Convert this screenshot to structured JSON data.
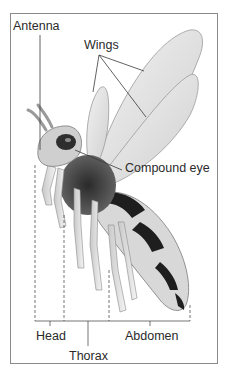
{
  "diagram": {
    "labels": {
      "antenna": "Antenna",
      "wings": "Wings",
      "compound_eye": "Compound eye",
      "head": "Head",
      "thorax": "Thorax",
      "abdomen": "Abdomen"
    },
    "colors": {
      "frame": "#8a8a8a",
      "text": "#2a2a2a",
      "leader_lines": "#3a3a3a",
      "wing_fill": "#e4e4e4",
      "body_dark": "#1e1e1e",
      "body_light": "#d6d6d6"
    }
  }
}
